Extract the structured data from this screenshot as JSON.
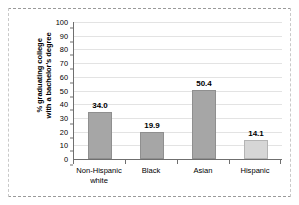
{
  "chart_data": {
    "type": "bar",
    "title": "",
    "xlabel": "",
    "ylabel_lines": [
      "% graduating college",
      "with a bachelor's degree"
    ],
    "ylabel": "% graduating college with a bachelor's degree",
    "categories": [
      "Non-Hispanic white",
      "Black",
      "Asian",
      "Hispanic"
    ],
    "category_lines": [
      [
        "Non-Hispanic",
        "white"
      ],
      [
        "Black"
      ],
      [
        "Asian"
      ],
      [
        "Hispanic"
      ]
    ],
    "values": [
      34.0,
      19.9,
      50.4,
      14.1
    ],
    "value_labels": [
      "34.0",
      "19.9",
      "50.4",
      "14.1"
    ],
    "ylim": [
      0,
      100
    ],
    "yticks": [
      0,
      10,
      20,
      30,
      40,
      50,
      60,
      70,
      80,
      90,
      100
    ],
    "ytick_labels": [
      "0",
      "10",
      "20",
      "30",
      "40",
      "50",
      "60",
      "70",
      "80",
      "90",
      "100"
    ],
    "grid": true,
    "legend": "none",
    "bar_colors": [
      "#a6a6a6",
      "#a6a6a6",
      "#a6a6a6",
      "#d6d6d6"
    ]
  },
  "style": {
    "bar_fill": "#a6a6a6",
    "bar_fill_light": "#d6d6d6",
    "axis_color": "#6f6f6f",
    "grid_color": "#e3e3e3",
    "text_color": "#000000",
    "background": "#ffffff",
    "frame_dash_color": "#9a9a9a"
  }
}
